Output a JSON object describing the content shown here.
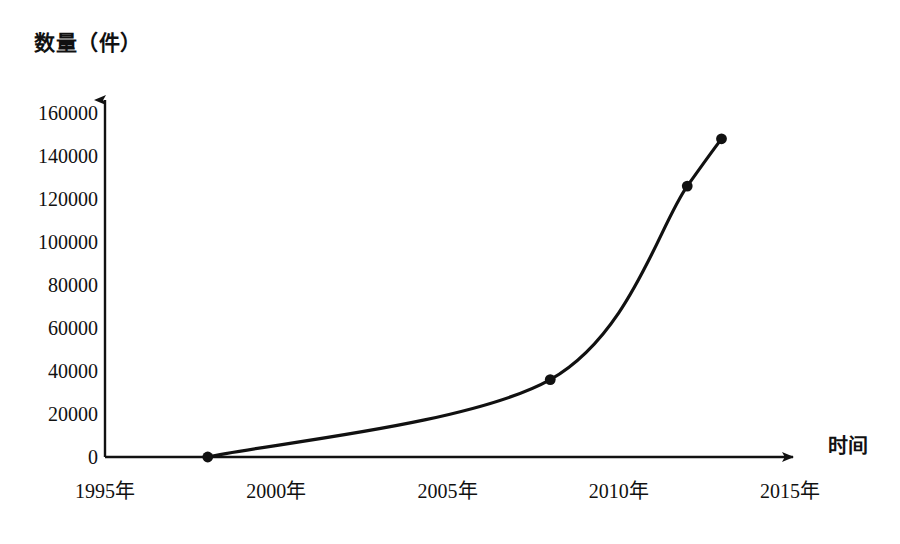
{
  "chart_data": {
    "type": "line",
    "title": "",
    "ylabel": "数量（件）",
    "xlabel": "时间",
    "x_tick_labels": [
      "1995年",
      "2000年",
      "2005年",
      "2010年",
      "2015年"
    ],
    "x_tick_values": [
      1995,
      2000,
      2005,
      2010,
      2015
    ],
    "y_tick_labels": [
      "0",
      "20000",
      "40000",
      "60000",
      "80000",
      "100000",
      "120000",
      "140000",
      "160000"
    ],
    "y_tick_values": [
      0,
      20000,
      40000,
      60000,
      80000,
      100000,
      120000,
      140000,
      160000
    ],
    "xlim": [
      1995,
      2015
    ],
    "ylim": [
      0,
      160000
    ],
    "grid": false,
    "legend": null,
    "series": [
      {
        "name": "数量（件）",
        "marker": "filled-circle",
        "color": "#111111",
        "points": [
          {
            "x": 1998,
            "y": 0
          },
          {
            "x": 2008,
            "y": 36000
          },
          {
            "x": 2012,
            "y": 126000
          },
          {
            "x": 2013,
            "y": 148000
          }
        ]
      }
    ],
    "axis_style": {
      "x_axis_arrow": true,
      "y_axis_arrow": true,
      "axis_color": "#111111"
    }
  }
}
